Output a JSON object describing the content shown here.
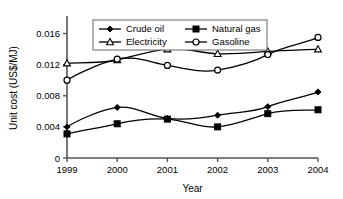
{
  "chart_data": {
    "type": "line",
    "title": "",
    "xlabel": "Year",
    "ylabel": "Unit cost (US$/MJ)",
    "categories": [
      "1999",
      "2000",
      "2001",
      "2002",
      "2003",
      "2004"
    ],
    "x": [
      1999,
      2000,
      2001,
      2002,
      2003,
      2004
    ],
    "xlim": [
      1999,
      2004
    ],
    "ylim": [
      0,
      0.018
    ],
    "yticks": [
      "0",
      "0.004",
      "0.008",
      "0.012",
      "0.016"
    ],
    "ytick_values": [
      0,
      0.004,
      0.008,
      0.012,
      0.016
    ],
    "grid": false,
    "legend_position": "top-center",
    "series": [
      {
        "name": "Crude oil",
        "marker": "filled-diamond",
        "color": "#000000",
        "values": [
          0.004,
          0.0065,
          0.0051,
          0.0055,
          0.0066,
          0.0085
        ]
      },
      {
        "name": "Natural gas",
        "marker": "filled-square",
        "color": "#000000",
        "values": [
          0.0031,
          0.0044,
          0.005,
          0.004,
          0.0057,
          0.0062
        ]
      },
      {
        "name": "Electricity",
        "marker": "open-triangle",
        "color": "#000000",
        "values": [
          0.0122,
          0.0126,
          0.014,
          0.0134,
          0.0137,
          0.014
        ]
      },
      {
        "name": "Gasoline",
        "marker": "open-circle",
        "color": "#000000",
        "values": [
          0.01,
          0.0127,
          0.0119,
          0.0113,
          0.0133,
          0.0155
        ]
      }
    ]
  },
  "legend": {
    "items": [
      {
        "label": "Crude oil"
      },
      {
        "label": "Natural gas"
      },
      {
        "label": "Electricity"
      },
      {
        "label": "Gasoline"
      }
    ]
  },
  "axes": {
    "y_title": "Unit cost (US$/MJ)",
    "x_title": "Year",
    "y_ticks": [
      "0.016",
      "0.012",
      "0.008",
      "0.004",
      "0"
    ],
    "x_ticks": [
      "1999",
      "2000",
      "2001",
      "2002",
      "2003",
      "2004"
    ]
  },
  "colors": {
    "line": "#000000",
    "axis": "#555555",
    "background": "#ffffff",
    "legend_border": "#666666"
  }
}
